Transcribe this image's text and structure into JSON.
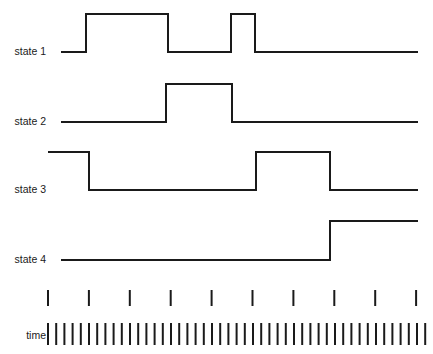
{
  "figure": {
    "kind": "timing-diagram",
    "width": 433,
    "height": 354,
    "background_color": "#ffffff",
    "line_color": "#1a1a1a",
    "line_width": 2
  },
  "rows": [
    {
      "label": "state 1",
      "label_x": 46,
      "label_y": 52,
      "low_y": 52,
      "high_y": 14,
      "x_start": 61,
      "x_end": 418,
      "initial_level": "low",
      "transitions": [
        {
          "x": 86,
          "to": "high"
        },
        {
          "x": 168,
          "to": "low"
        },
        {
          "x": 231,
          "to": "high"
        },
        {
          "x": 255,
          "to": "low"
        }
      ]
    },
    {
      "label": "state 2",
      "label_x": 46,
      "label_y": 122,
      "low_y": 122,
      "high_y": 84,
      "x_start": 61,
      "x_end": 418,
      "initial_level": "low",
      "transitions": [
        {
          "x": 166,
          "to": "high"
        },
        {
          "x": 232,
          "to": "low"
        }
      ]
    },
    {
      "label": "state 3",
      "label_x": 46,
      "label_y": 190,
      "low_y": 190,
      "high_y": 152,
      "x_start": 48,
      "x_end": 418,
      "initial_level": "high",
      "transitions": [
        {
          "x": 89,
          "to": "low"
        },
        {
          "x": 256,
          "to": "high"
        },
        {
          "x": 330,
          "to": "low"
        }
      ]
    },
    {
      "label": "state 4",
      "label_x": 46,
      "label_y": 260,
      "low_y": 260,
      "high_y": 221,
      "x_start": 61,
      "x_end": 418,
      "initial_level": "low",
      "transitions": [
        {
          "x": 330,
          "to": "high"
        }
      ]
    }
  ],
  "time_axis": {
    "label": "time",
    "label_x": 46,
    "label_y": 336,
    "major_ticks": {
      "count": 10,
      "x_start": 48,
      "x_step": 40.9,
      "y_top": 290,
      "y_bottom": 306
    },
    "minor_ticks": {
      "count": 47,
      "x_start": 48,
      "x_step": 8.2,
      "y_top": 323,
      "y_bottom": 345
    }
  }
}
